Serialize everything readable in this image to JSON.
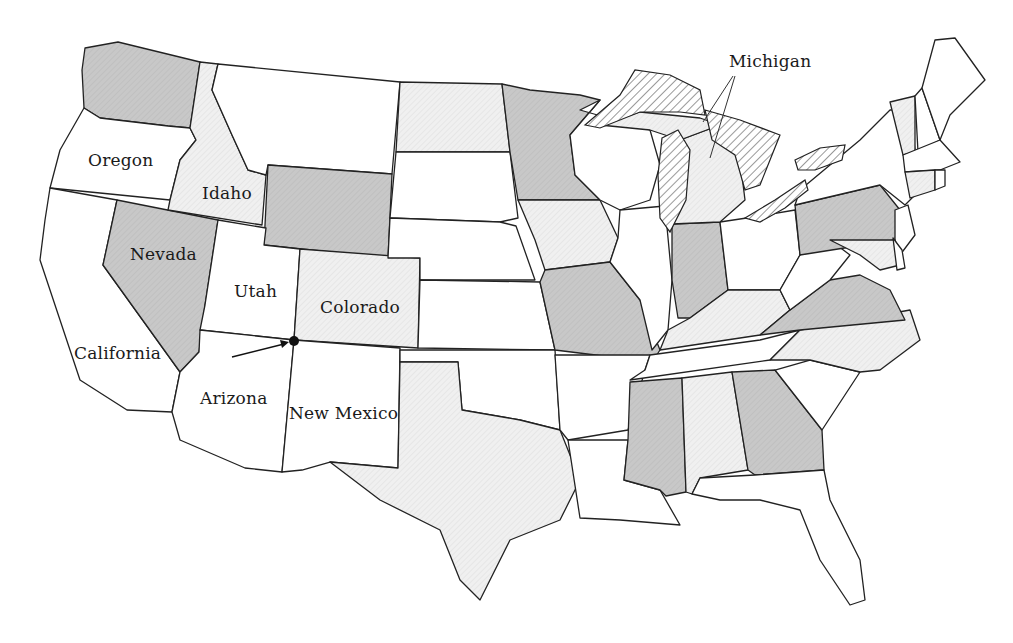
{
  "map": {
    "title": "Contiguous United States (four-color style map)",
    "colors": {
      "white": "#ffffff",
      "light": "#ececec",
      "dark": "#c4c4c4",
      "lakes_hatch": "#555555",
      "border": "#222222"
    },
    "labels": {
      "oregon": "Oregon",
      "idaho": "Idaho",
      "nevada": "Nevada",
      "utah": "Utah",
      "colorado": "Colorado",
      "california": "California",
      "arizona": "Arizona",
      "new_mexico": "New Mexico",
      "michigan": "Michigan"
    },
    "annotations": {
      "four_corners_point": "Four Corners point (UT/CO/AZ/NM)",
      "michigan_callout": "Michigan (two peninsulas)"
    },
    "shading": {
      "dark": [
        "Washington",
        "Nevada",
        "Wyoming",
        "Minnesota",
        "Missouri",
        "Indiana",
        "Pennsylvania",
        "Virginia",
        "Mississippi",
        "Georgia"
      ],
      "light": [
        "Idaho",
        "Colorado",
        "North Dakota",
        "Iowa",
        "Texas",
        "Kentucky",
        "Alabama",
        "North Carolina",
        "Michigan",
        "Vermont",
        "Connecticut",
        "Maryland"
      ],
      "white": [
        "Oregon",
        "California",
        "Montana",
        "Utah",
        "Arizona",
        "New Mexico",
        "South Dakota",
        "Nebraska",
        "Kansas",
        "Oklahoma",
        "Arkansas",
        "Louisiana",
        "Wisconsin",
        "Illinois",
        "Ohio",
        "Tennessee",
        "Florida",
        "South Carolina",
        "West Virginia",
        "New York",
        "New Hampshire",
        "Maine",
        "Massachusetts",
        "New Jersey",
        "Delaware",
        "Rhode Island"
      ],
      "hatched_lakes": [
        "Lake Superior",
        "Lake Michigan",
        "Lake Huron",
        "Lake Erie",
        "Lake Ontario"
      ]
    }
  }
}
